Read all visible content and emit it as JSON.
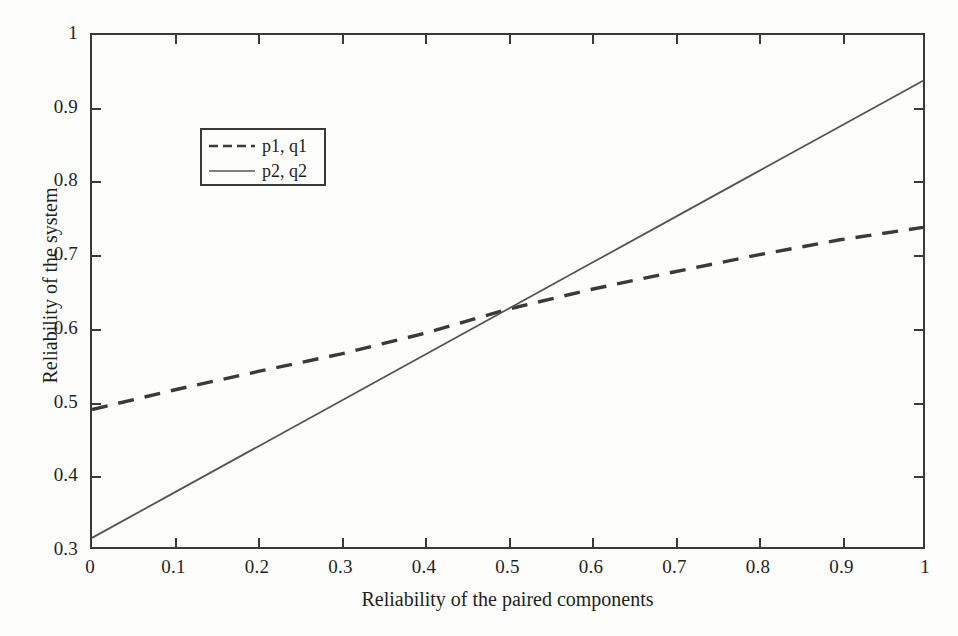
{
  "chart_data": {
    "type": "line",
    "title": "",
    "xlabel": "Reliability of the paired components",
    "ylabel": "Reliability of the system",
    "xlim": [
      0,
      1
    ],
    "ylim": [
      0.3,
      1
    ],
    "xticks": [
      "0",
      "0.1",
      "0.2",
      "0.3",
      "0.4",
      "0.5",
      "0.6",
      "0.7",
      "0.8",
      "0.9",
      "1"
    ],
    "xtick_values": [
      0,
      0.1,
      0.2,
      0.3,
      0.4,
      0.5,
      0.6,
      0.7,
      0.8,
      0.9,
      1
    ],
    "yticks": [
      "0.3",
      "0.4",
      "0.5",
      "0.6",
      "0.7",
      "0.8",
      "0.9",
      "1"
    ],
    "ytick_values": [
      0.3,
      0.4,
      0.5,
      0.6,
      0.7,
      0.8,
      0.9,
      1
    ],
    "grid": false,
    "legend_position": "upper-left-inside",
    "x": [
      0,
      0.1,
      0.2,
      0.3,
      0.4,
      0.5,
      0.6,
      0.7,
      0.8,
      0.9,
      1
    ],
    "series": [
      {
        "name": "p1, q1",
        "style": "dashed",
        "color": "#3a3a3a",
        "values": [
          0.488,
          0.515,
          0.54,
          0.564,
          0.592,
          0.625,
          0.652,
          0.676,
          0.699,
          0.72,
          0.737
        ]
      },
      {
        "name": "p2, q2",
        "style": "solid",
        "color": "#555555",
        "values": [
          0.3125,
          0.375,
          0.4375,
          0.5,
          0.5625,
          0.625,
          0.6875,
          0.75,
          0.8125,
          0.875,
          0.9375
        ]
      }
    ],
    "intersection": {
      "x": 0.5,
      "y": 0.625
    }
  },
  "legend": {
    "entries": [
      {
        "label": "p1, q1"
      },
      {
        "label": "p2, q2"
      }
    ]
  },
  "colors": {
    "axis": "#3a3a3a",
    "background": "#fdfdfb",
    "series_dashed": "#3a3a3a",
    "series_solid": "#555555"
  }
}
